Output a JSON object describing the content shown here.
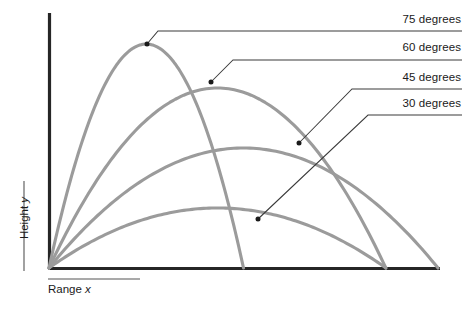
{
  "chart_data": {
    "type": "line",
    "title": "",
    "subtitle": "",
    "xlabel": "Range x",
    "ylabel": "Height y",
    "grid": false,
    "legend_position": "right-callouts",
    "xlim": [
      0,
      1.05
    ],
    "ylim": [
      0,
      1.05
    ],
    "axis_ticks": [],
    "series": [
      {
        "name": "75 degrees",
        "angle_degrees": 75,
        "color": "#9b9b9b",
        "range_normalized": 0.5,
        "peak_height_normalized": 0.933,
        "peak_x_normalized": 0.25,
        "x": [
          0.0,
          0.05,
          0.1,
          0.15,
          0.2,
          0.25,
          0.3,
          0.35,
          0.4,
          0.45,
          0.5
        ],
        "y": [
          0.0,
          0.336,
          0.597,
          0.784,
          0.896,
          0.933,
          0.896,
          0.784,
          0.597,
          0.336,
          0.0
        ]
      },
      {
        "name": "60 degrees",
        "angle_degrees": 60,
        "color": "#9b9b9b",
        "range_normalized": 0.866,
        "peak_height_normalized": 0.75,
        "peak_x_normalized": 0.433,
        "x": [
          0.0,
          0.0866,
          0.1732,
          0.2598,
          0.3464,
          0.433,
          0.5196,
          0.6062,
          0.6928,
          0.7794,
          0.866
        ],
        "y": [
          0.0,
          0.27,
          0.48,
          0.63,
          0.72,
          0.75,
          0.72,
          0.63,
          0.48,
          0.27,
          0.0
        ]
      },
      {
        "name": "45 degrees",
        "angle_degrees": 45,
        "color": "#9b9b9b",
        "range_normalized": 1.0,
        "peak_height_normalized": 0.5,
        "peak_x_normalized": 0.5,
        "x": [
          0.0,
          0.1,
          0.2,
          0.3,
          0.4,
          0.5,
          0.6,
          0.7,
          0.8,
          0.9,
          1.0
        ],
        "y": [
          0.0,
          0.18,
          0.32,
          0.42,
          0.48,
          0.5,
          0.48,
          0.42,
          0.32,
          0.18,
          0.0
        ]
      },
      {
        "name": "30 degrees",
        "angle_degrees": 30,
        "color": "#9b9b9b",
        "range_normalized": 0.866,
        "peak_height_normalized": 0.25,
        "peak_x_normalized": 0.433,
        "x": [
          0.0,
          0.0866,
          0.1732,
          0.2598,
          0.3464,
          0.433,
          0.5196,
          0.6062,
          0.6928,
          0.7794,
          0.866
        ],
        "y": [
          0.0,
          0.09,
          0.16,
          0.21,
          0.24,
          0.25,
          0.24,
          0.21,
          0.16,
          0.09,
          0.0
        ]
      }
    ],
    "callouts": [
      {
        "label": "75 degrees",
        "anchor_x_px": 147,
        "anchor_y_px": 44,
        "elbow_x_px": 158,
        "elbow_y_px": 31,
        "rule_y_px": 31,
        "rule_end_x_px": 462
      },
      {
        "label": "60 degrees",
        "anchor_x_px": 211,
        "anchor_y_px": 82,
        "elbow_x_px": 233,
        "elbow_y_px": 60,
        "rule_y_px": 60,
        "rule_end_x_px": 462
      },
      {
        "label": "45 degrees",
        "anchor_x_px": 299,
        "anchor_y_px": 143,
        "elbow_x_px": 352,
        "elbow_y_px": 89,
        "rule_y_px": 89,
        "rule_end_x_px": 462
      },
      {
        "label": "30 degrees",
        "anchor_x_px": 258,
        "anchor_y_px": 219,
        "elbow_x_px": 368,
        "elbow_y_px": 115,
        "rule_y_px": 115,
        "rule_end_x_px": 462
      }
    ]
  },
  "axes": {
    "y_axis_label_main": "Height",
    "y_axis_label_var": "y",
    "x_axis_label_main": "Range",
    "x_axis_label_var": "x",
    "axis_color": "#262626",
    "curve_color": "#9b9b9b",
    "leader_color": "#3a3a3a"
  },
  "labels": {
    "deg75": "75 degrees",
    "deg60": "60 degrees",
    "deg45": "45 degrees",
    "deg30": "30 degrees"
  }
}
